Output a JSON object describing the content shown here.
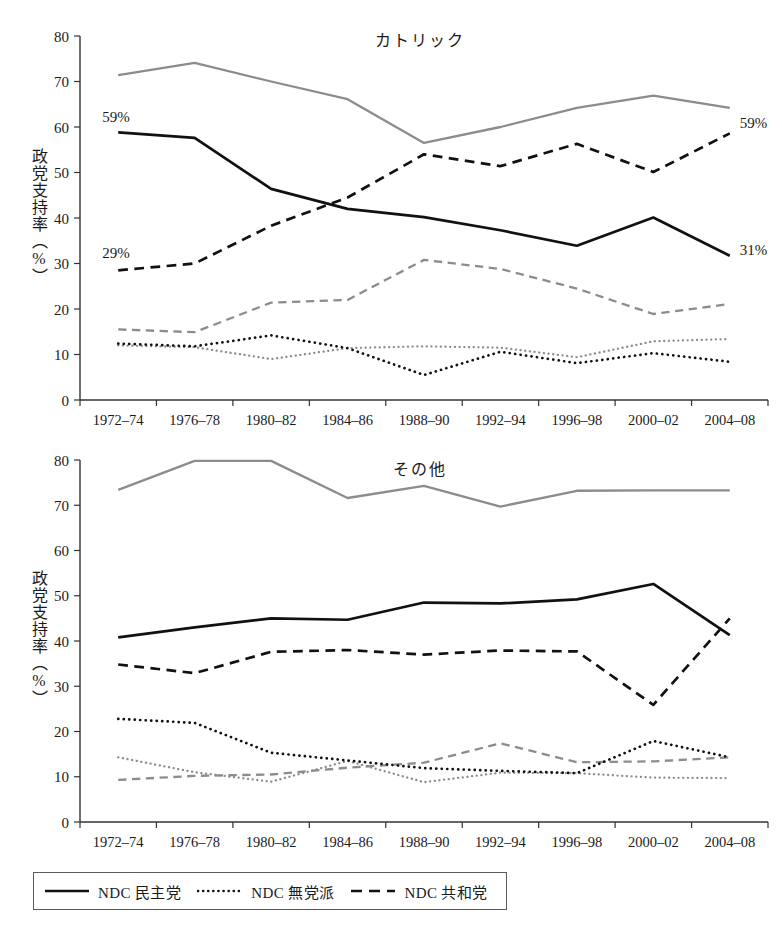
{
  "figure": {
    "y_axis_label": "政党支持率（%）",
    "legend": {
      "entries": [
        {
          "label": "NDC 民主党",
          "style": "solid",
          "color": "#111111",
          "swatch": "solid-line-swatch"
        },
        {
          "label": "NDC 無党派",
          "style": "dotted",
          "color": "#111111",
          "swatch": "dotted-line-swatch"
        },
        {
          "label": "NDC 共和党",
          "style": "dashed",
          "color": "#111111",
          "swatch": "dashed-line-swatch"
        }
      ]
    }
  },
  "chart_data": [
    {
      "type": "line",
      "title": "カトリック",
      "xlabel": "",
      "ylabel": "政党支持率（%）",
      "ylim": [
        0,
        80
      ],
      "yticks": [
        0,
        10,
        20,
        30,
        40,
        50,
        60,
        70,
        80
      ],
      "grid": false,
      "legend_position": "below-figure",
      "categories": [
        "1972–74",
        "1976–78",
        "1980–82",
        "1984–86",
        "1988–90",
        "1992–94",
        "1996–98",
        "2000–02",
        "2004–08"
      ],
      "series": [
        {
          "name": "NDC 民主党 (黒・実線)",
          "style": "solid",
          "color": "#111111",
          "values": [
            58.8,
            57.6,
            46.4,
            42.0,
            40.2,
            37.3,
            33.9,
            40.1,
            31.7
          ]
        },
        {
          "name": "NDC 共和党 (黒・破線)",
          "style": "dashed",
          "color": "#111111",
          "values": [
            28.5,
            30.0,
            38.3,
            44.5,
            54.0,
            51.4,
            56.3,
            50.1,
            58.6
          ]
        },
        {
          "name": "NDC 無党派 (黒・点線)",
          "style": "dotted",
          "color": "#111111",
          "values": [
            12.4,
            11.8,
            14.2,
            11.4,
            5.5,
            10.6,
            8.1,
            10.3,
            8.4
          ]
        },
        {
          "name": "民主党 (灰・実線)",
          "style": "solid",
          "color": "#8c8c8c",
          "values": [
            71.4,
            74.1,
            70.0,
            66.1,
            56.5,
            60.0,
            64.2,
            66.9,
            64.2
          ]
        },
        {
          "name": "共和党 (灰・破線)",
          "style": "dashed",
          "color": "#8c8c8c",
          "values": [
            15.5,
            14.9,
            21.4,
            22.0,
            30.8,
            28.8,
            24.5,
            18.9,
            21.1
          ]
        },
        {
          "name": "無党派 (灰・点線)",
          "style": "dotted",
          "color": "#8c8c8c",
          "values": [
            12.0,
            11.6,
            9.0,
            11.4,
            11.8,
            11.5,
            9.4,
            12.9,
            13.4
          ]
        }
      ],
      "annotations": [
        {
          "text": "59%",
          "category": "1972–74",
          "value": 59,
          "placement": "below-left"
        },
        {
          "text": "29%",
          "category": "1972–74",
          "value": 29,
          "placement": "below-left"
        },
        {
          "text": "59%",
          "category": "2004–08",
          "value": 59,
          "placement": "right"
        },
        {
          "text": "31%",
          "category": "2004–08",
          "value": 31,
          "placement": "right"
        }
      ]
    },
    {
      "type": "line",
      "title": "その他",
      "xlabel": "",
      "ylabel": "政党支持率（%）",
      "ylim": [
        0,
        80
      ],
      "yticks": [
        0,
        10,
        20,
        30,
        40,
        50,
        60,
        70,
        80
      ],
      "grid": false,
      "legend_position": "below-figure",
      "categories": [
        "1972–74",
        "1976–78",
        "1980–82",
        "1984–86",
        "1988–90",
        "1992–94",
        "1996–98",
        "2000–02",
        "2004–08"
      ],
      "series": [
        {
          "name": "NDC 民主党 (黒・実線)",
          "style": "solid",
          "color": "#111111",
          "values": [
            40.8,
            43.0,
            45.0,
            44.7,
            48.5,
            48.3,
            49.2,
            52.6,
            41.3
          ]
        },
        {
          "name": "NDC 共和党 (黒・破線)",
          "style": "dashed",
          "color": "#111111",
          "values": [
            34.8,
            32.9,
            37.6,
            38.0,
            37.0,
            37.9,
            37.7,
            25.9,
            45.0
          ]
        },
        {
          "name": "NDC 無党派 (黒・点線)",
          "style": "dotted",
          "color": "#111111",
          "values": [
            22.8,
            21.9,
            15.3,
            13.6,
            11.9,
            11.3,
            10.8,
            17.9,
            14.3
          ]
        },
        {
          "name": "民主党 (灰・実線)",
          "style": "solid",
          "color": "#8c8c8c",
          "values": [
            73.4,
            79.8,
            79.8,
            71.6,
            74.3,
            69.7,
            73.2,
            73.3,
            73.3
          ]
        },
        {
          "name": "共和党 (灰・破線)",
          "style": "dashed",
          "color": "#8c8c8c",
          "values": [
            9.3,
            10.2,
            10.5,
            12.0,
            13.1,
            17.4,
            13.2,
            13.4,
            14.3
          ]
        },
        {
          "name": "無党派 (灰・点線)",
          "style": "dotted",
          "color": "#8c8c8c",
          "values": [
            14.3,
            11.0,
            8.9,
            13.5,
            8.8,
            10.9,
            10.8,
            9.8,
            9.7
          ]
        }
      ],
      "annotations": []
    }
  ]
}
